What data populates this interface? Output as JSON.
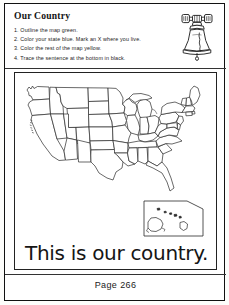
{
  "worksheet": {
    "title": "Our Country",
    "instructions": [
      "1. Outline the map green.",
      "2. Color your state blue. Mark an X where you live.",
      "3. Color the rest of the map yellow.",
      "4. Trace the sentence at the bottom in black."
    ],
    "trace_sentence": "This is our country.",
    "page_number": "Page 266"
  },
  "illustration": {
    "bell_name": "liberty-bell-icon"
  },
  "map": {
    "region_label": "united-states-map",
    "inset_label": "alaska-hawaii-inset"
  },
  "colors": {
    "ink": "#141414",
    "frame": "#111111",
    "paper": "#ffffff"
  }
}
